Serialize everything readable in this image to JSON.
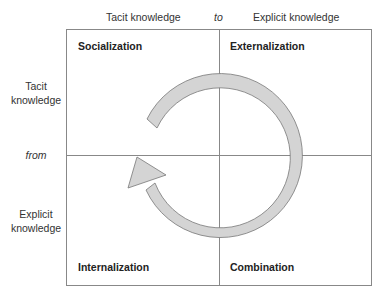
{
  "diagram": {
    "type": "SECI knowledge conversion matrix",
    "top_axis": {
      "left_label": "Tacit knowledge",
      "connector": "to",
      "right_label": "Explicit knowledge"
    },
    "left_axis": {
      "top_label": "Tacit knowledge",
      "connector": "from",
      "bottom_label": "Explicit knowledge"
    },
    "quadrants": {
      "top_left": "Socialization",
      "top_right": "Externalization",
      "bottom_right": "Combination",
      "bottom_left": "Internalization"
    },
    "cycle_arrow": {
      "direction": "clockwise",
      "fill": "#d4d4d4",
      "stroke": "#777777"
    },
    "colors": {
      "grid_line": "#888888",
      "text": "#333333"
    }
  }
}
